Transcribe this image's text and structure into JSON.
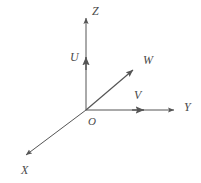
{
  "figure": {
    "type": "vector-coordinate-axes-diagram",
    "background_color": "#ffffff",
    "stroke_color": "#555555",
    "label_color": "#4a4a4a",
    "width": 201,
    "height": 183
  },
  "origin": {
    "label": "O",
    "x": 86,
    "y": 110,
    "label_x": 88,
    "label_y": 116
  },
  "axes": [
    {
      "name": "z-axis",
      "label": "Z",
      "from_x": 86,
      "from_y": 110,
      "to_x": 86,
      "to_y": 14,
      "label_x": 92,
      "label_y": 5
    },
    {
      "name": "y-axis",
      "label": "Y",
      "from_x": 86,
      "from_y": 110,
      "to_x": 178,
      "to_y": 110,
      "label_x": 184,
      "label_y": 101
    },
    {
      "name": "x-axis",
      "label": "X",
      "from_x": 86,
      "from_y": 110,
      "to_x": 22,
      "to_y": 158,
      "label_x": 21,
      "label_y": 164
    }
  ],
  "vectors": [
    {
      "name": "u-vector",
      "label": "U",
      "from_x": 86,
      "from_y": 110,
      "to_x": 86,
      "to_y": 53,
      "label_x": 70,
      "label_y": 51
    },
    {
      "name": "v-vector",
      "label": "V",
      "from_x": 86,
      "from_y": 110,
      "to_x": 148,
      "to_y": 110,
      "label_x": 134,
      "label_y": 89
    },
    {
      "name": "w-vector",
      "label": "W",
      "from_x": 86,
      "from_y": 110,
      "to_x": 137,
      "to_y": 67,
      "label_x": 143,
      "label_y": 54
    }
  ]
}
